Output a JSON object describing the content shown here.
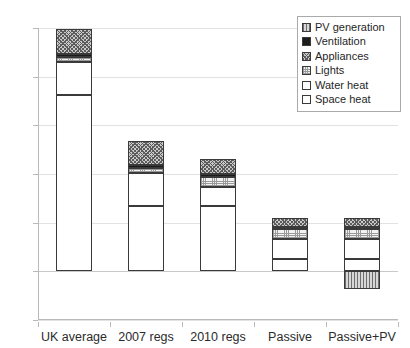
{
  "chart_data": {
    "type": "bar",
    "title": "",
    "xlabel": "",
    "ylabel": "",
    "stacked": true,
    "grid": true,
    "legend_position": "top-right",
    "ylim": [
      -50,
      250
    ],
    "yticks": [
      -50,
      0,
      50,
      100,
      150,
      200,
      250
    ],
    "ytick_labels": [
      "-50",
      "0",
      "50",
      "100",
      "150",
      "200",
      "250"
    ],
    "categories": [
      "UK average",
      "2007 regs",
      "2010 regs",
      "Passive",
      "Passive+PV"
    ],
    "series": [
      {
        "name": "Space heat",
        "key": "space",
        "values": [
          181,
          67,
          67,
          13,
          13
        ]
      },
      {
        "name": "Water heat",
        "key": "water",
        "values": [
          34,
          34,
          20,
          20,
          20
        ]
      },
      {
        "name": "Lights",
        "key": "lights",
        "values": [
          5,
          5,
          10,
          10,
          10
        ]
      },
      {
        "name": "Ventilation",
        "key": "vent",
        "values": [
          3,
          3,
          3,
          3,
          3
        ]
      },
      {
        "name": "Appliances",
        "key": "appl",
        "values": [
          26,
          25,
          15,
          9,
          9
        ]
      },
      {
        "name": "PV generation",
        "key": "pv",
        "values": [
          0,
          0,
          0,
          0,
          -18
        ]
      }
    ],
    "totals_positive": [
      249,
      134,
      115,
      55,
      55
    ]
  },
  "legend": {
    "items": [
      {
        "label": "PV generation",
        "swatch": "pv-swatch"
      },
      {
        "label": "Ventilation",
        "swatch": "ventilation-swatch"
      },
      {
        "label": "Appliances",
        "swatch": "appliances-swatch"
      },
      {
        "label": "Lights",
        "swatch": "lights-swatch"
      },
      {
        "label": "Water heat",
        "swatch": "water-heat-swatch"
      },
      {
        "label": "Space heat",
        "swatch": "space-heat-swatch"
      }
    ]
  }
}
